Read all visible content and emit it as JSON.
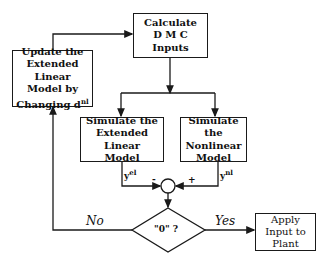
{
  "diagram": {
    "type": "flowchart",
    "nodes": {
      "calculate": {
        "lines": [
          "Calculate",
          "D M C",
          "Inputs"
        ]
      },
      "update": {
        "lines": [
          "Update the",
          "Extended Linear",
          "Model by",
          "Changing d"
        ],
        "superscript": "nl"
      },
      "sim_linear": {
        "lines": [
          "Simulate the",
          "Extended Linear",
          "Model"
        ]
      },
      "sim_nonlinear": {
        "lines": [
          "Simulate the",
          "Nonlinear",
          "Model"
        ]
      },
      "decision": {
        "label": "\"0\" ?"
      },
      "apply": {
        "lines": [
          "Apply",
          "Input to",
          "Plant"
        ]
      }
    },
    "signals": {
      "y_linear": {
        "base": "y",
        "sup": "el"
      },
      "y_nonlinear": {
        "base": "y",
        "sup": "nl"
      },
      "minus": "-",
      "plus": "+"
    },
    "branches": {
      "no": "No",
      "yes": "Yes"
    },
    "edges": [
      [
        "calculate",
        "sim_linear"
      ],
      [
        "calculate",
        "sim_nonlinear"
      ],
      [
        "sim_linear",
        "sum(-)"
      ],
      [
        "sim_nonlinear",
        "sum(+)"
      ],
      [
        "sum",
        "decision"
      ],
      [
        "decision",
        "apply",
        "Yes"
      ],
      [
        "decision",
        "update",
        "No"
      ],
      [
        "update",
        "calculate"
      ]
    ]
  }
}
